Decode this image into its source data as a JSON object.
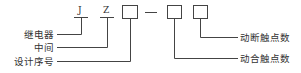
{
  "diagram": {
    "code_letters": [
      {
        "letter": "J",
        "meaning": "继电器"
      },
      {
        "letter": "Z",
        "meaning": "中间"
      }
    ],
    "boxes": [
      {
        "meaning": "设计序号"
      },
      {
        "meaning": "动合触点数"
      },
      {
        "meaning": "动断触点数"
      }
    ],
    "separator": "—",
    "left_labels": [
      "继电器",
      "中间",
      "设计序号"
    ],
    "right_labels": [
      "动断触点数",
      "动合触点数"
    ],
    "line_color": "#333333"
  }
}
